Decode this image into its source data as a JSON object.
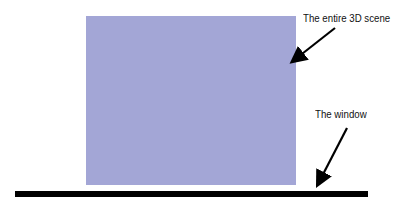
{
  "diagram": {
    "scene": {
      "label": "The entire 3D scene",
      "color": "#a3a6d6"
    },
    "window": {
      "label": "The window",
      "color": "#000000"
    },
    "arrow_color": "#000000"
  }
}
